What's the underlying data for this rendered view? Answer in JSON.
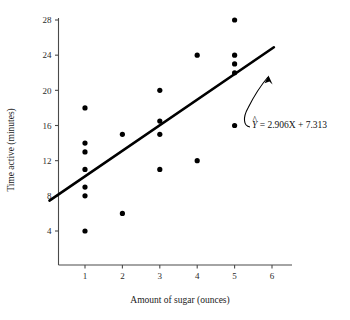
{
  "chart_data": {
    "type": "scatter",
    "title": "",
    "xlabel": "Amount of sugar (ounces)",
    "ylabel": "Time active (minutes)",
    "xlim": [
      0,
      6.6
    ],
    "ylim": [
      0,
      29
    ],
    "grid": false,
    "legend": "none",
    "xticks": [
      "1",
      "2",
      "3",
      "4",
      "5",
      "6"
    ],
    "xtick_values": [
      1,
      2,
      3,
      4,
      5,
      6
    ],
    "yticks": [
      "4",
      "8",
      "12",
      "16",
      "20",
      "24",
      "28"
    ],
    "ytick_values": [
      4,
      8,
      12,
      16,
      20,
      24,
      28
    ],
    "points": [
      {
        "x": 1,
        "y": 18
      },
      {
        "x": 1,
        "y": 14
      },
      {
        "x": 1,
        "y": 13
      },
      {
        "x": 1,
        "y": 11
      },
      {
        "x": 1,
        "y": 9
      },
      {
        "x": 1,
        "y": 8
      },
      {
        "x": 1,
        "y": 4
      },
      {
        "x": 2,
        "y": 15
      },
      {
        "x": 2,
        "y": 6
      },
      {
        "x": 3,
        "y": 20
      },
      {
        "x": 3,
        "y": 16.5
      },
      {
        "x": 3,
        "y": 15
      },
      {
        "x": 3,
        "y": 11
      },
      {
        "x": 4,
        "y": 24
      },
      {
        "x": 4,
        "y": 12
      },
      {
        "x": 5,
        "y": 28
      },
      {
        "x": 5,
        "y": 24
      },
      {
        "x": 5,
        "y": 23
      },
      {
        "x": 5,
        "y": 22
      },
      {
        "x": 5,
        "y": 16
      }
    ],
    "regression": {
      "slope": 2.906,
      "intercept": 7.313,
      "x_start": 0.05,
      "x_end": 6.05
    },
    "annotation": {
      "equation_prefix": "Y",
      "equation_rest": " = 2.906X + 7.313",
      "hat": "^",
      "points_to": "regression-line"
    },
    "marker": {
      "shape": "circle",
      "radius": 2.6,
      "color": "#000000"
    },
    "line_color": "#000000",
    "axis_color": "#4a4a4a",
    "background": "#ffffff"
  }
}
